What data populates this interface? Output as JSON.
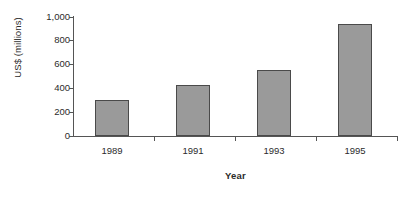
{
  "chart_data": {
    "type": "bar",
    "title": "",
    "xlabel": "Year",
    "ylabel": "US$ (millions)",
    "categories": [
      "1989",
      "1991",
      "1993",
      "1995"
    ],
    "values": [
      300,
      425,
      550,
      940
    ],
    "series": [
      {
        "name": "US$ (millions)",
        "values": [
          300,
          425,
          550,
          940
        ]
      }
    ],
    "ylim": [
      0,
      1000
    ],
    "ytick_values": [
      0,
      200,
      400,
      600,
      800,
      1000
    ],
    "ytick_labels": [
      "0",
      "200",
      "400",
      "600",
      "800",
      "1,000"
    ],
    "grid": false,
    "legend": false,
    "legend_position": "none",
    "bar_color": "#9a9a9a",
    "bar_border_color": "#4a4a4a",
    "axis_color": "#555555",
    "background_color": "#ffffff",
    "text_color": "#2b2b2b"
  }
}
